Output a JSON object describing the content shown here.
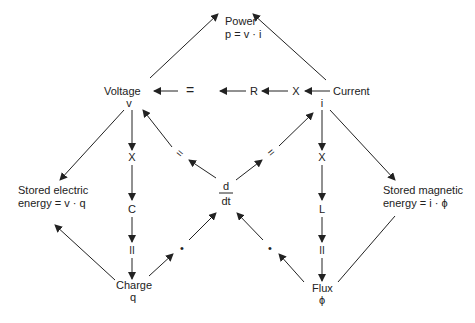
{
  "diagram": {
    "nodes": {
      "power": {
        "label": "Power",
        "formula": "p =  v · i"
      },
      "voltage": {
        "label": "Voltage",
        "symbol": "v"
      },
      "current": {
        "label": "Current",
        "symbol": "i"
      },
      "charge": {
        "label": "Charge",
        "symbol": "q"
      },
      "flux": {
        "label": "Flux",
        "symbol": "ϕ"
      },
      "stored_electric": {
        "line1": "Stored electric",
        "line2": "energy = v · q"
      },
      "stored_magnetic": {
        "line1": "Stored magnetic",
        "line2": "energy = i · ϕ"
      },
      "derivative": {
        "numerator": "d",
        "denominator": "dt"
      }
    },
    "operators": {
      "top_equals": "=",
      "top_resistance": "R",
      "top_times": "X",
      "left_times": "X",
      "left_capacitance": "C",
      "left_equals": "II",
      "right_times": "X",
      "right_inductance": "L",
      "right_equals": "II",
      "diag_equals_left": "=",
      "diag_equals_right": "=",
      "dot_left": "•",
      "dot_right": "•"
    },
    "colors": {
      "ink": "#222222",
      "background": "#ffffff"
    }
  }
}
